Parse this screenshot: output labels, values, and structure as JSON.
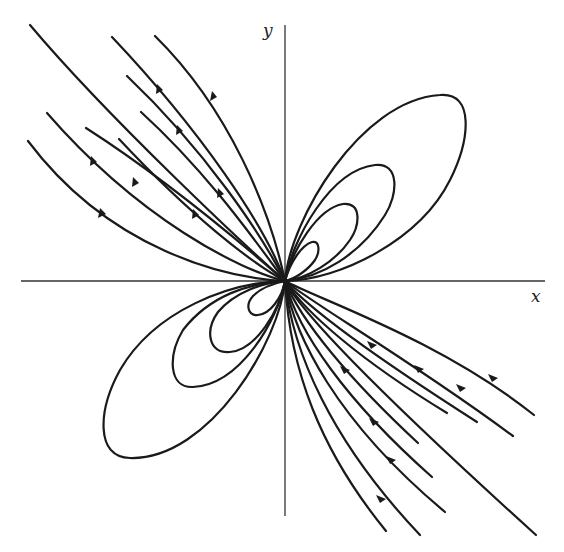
{
  "diagram": {
    "type": "phase-portrait",
    "axes": {
      "x_label": "x",
      "y_label": "y"
    },
    "colors": {
      "stroke": "#1a1a1a",
      "axis": "#333333",
      "background": "#ffffff"
    },
    "trajectories": {
      "upper_left_count": 9,
      "lower_right_count": 10,
      "loops_first_quadrant": 4,
      "loops_third_quadrant": 4,
      "arrow_direction": "away from origin"
    }
  }
}
